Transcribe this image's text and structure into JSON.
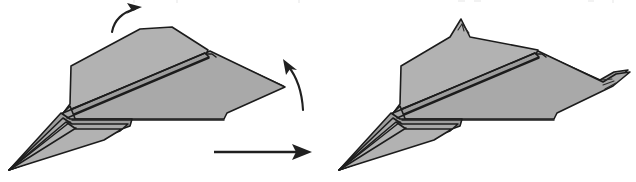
{
  "document": {
    "kind": "origami-instruction-diagram",
    "title": "Paper airplane folding step",
    "panel_count": 2,
    "background_color": "#ffffff"
  },
  "palette": {
    "paper_fill": "#a9a9a9",
    "paper_fill_shade": "#9d9d9d",
    "paper_fill_light": "#b2b2b2",
    "outline": "#1c1c1c",
    "arrow": "#202020"
  },
  "panels": [
    {
      "id": "before",
      "name": "before-fold-panel",
      "label": "",
      "description": "Paper airplane seen from above-right before the wingtips are folded up",
      "arrows": [
        {
          "name": "fold-up-nose-arrow",
          "label": "",
          "direction": "curve-up-right",
          "meaning": "fold peak upward"
        },
        {
          "name": "fold-up-wingtip-arrow",
          "label": "",
          "direction": "curve-up-left",
          "meaning": "fold right wingtip upward"
        }
      ]
    },
    {
      "id": "after",
      "name": "after-fold-panel",
      "label": "",
      "description": "Paper airplane after the peak and right wingtip have been folded up",
      "arrows": []
    }
  ],
  "transition": {
    "name": "step-transition-arrow",
    "label": "",
    "direction": "right",
    "meaning": "proceed to next step"
  }
}
